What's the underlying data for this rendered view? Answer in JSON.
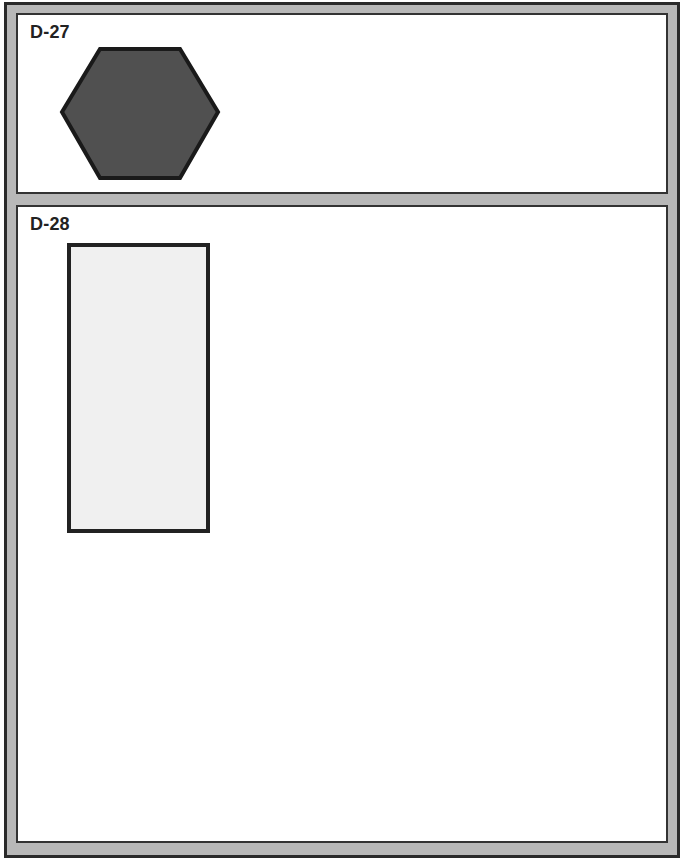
{
  "panels": [
    {
      "id": "D-27",
      "label": "D-27",
      "shape": {
        "type": "hexagon",
        "icon": "hexagon-icon",
        "fill": "#505050",
        "stroke": "#1a1a1a",
        "stroke_width": 4
      }
    },
    {
      "id": "D-28",
      "label": "D-28",
      "shape": {
        "type": "rectangle",
        "icon": "rectangle-icon",
        "fill": "#f0f0f0",
        "stroke": "#222222",
        "stroke_width": 4
      }
    }
  ],
  "colors": {
    "frame_fill": "#b8b8b8",
    "frame_border": "#2a2a2a",
    "panel_bg": "#ffffff",
    "panel_border": "#333333"
  }
}
